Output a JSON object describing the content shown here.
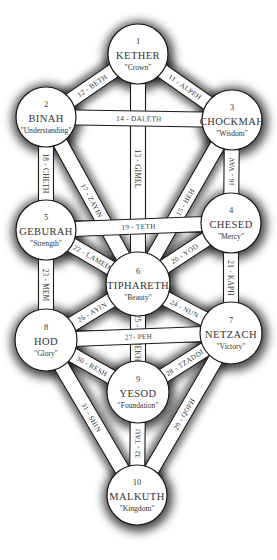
{
  "diagram": {
    "sephiroth": [
      {
        "id": 1,
        "number": "1",
        "name": "KETHER",
        "meaning": "\"Crown\"",
        "cx": 138,
        "cy": 54,
        "r": 30
      },
      {
        "id": 2,
        "number": "2",
        "name": "BINAH",
        "meaning": "\"Understanding\"",
        "cx": 46,
        "cy": 117,
        "r": 30
      },
      {
        "id": 3,
        "number": "3",
        "name": "CHOCKMAH",
        "meaning": "\"Wisdom\"",
        "cx": 232,
        "cy": 120,
        "r": 30
      },
      {
        "id": 4,
        "number": "4",
        "name": "CHESED",
        "meaning": "\"Mercy\"",
        "cx": 231,
        "cy": 223,
        "r": 30
      },
      {
        "id": 5,
        "number": "5",
        "name": "GEBURAH",
        "meaning": "\"Strength\"",
        "cx": 46,
        "cy": 230,
        "r": 30
      },
      {
        "id": 6,
        "number": "6",
        "name": "TIPHARETH",
        "meaning": "\"Beauty\"",
        "cx": 138,
        "cy": 284,
        "r": 32
      },
      {
        "id": 7,
        "number": "7",
        "name": "NETZACH",
        "meaning": "\"Victory\"",
        "cx": 231,
        "cy": 333,
        "r": 31
      },
      {
        "id": 8,
        "number": "8",
        "name": "HOD",
        "meaning": "\"Glory\"",
        "cx": 46,
        "cy": 340,
        "r": 31
      },
      {
        "id": 9,
        "number": "9",
        "name": "YESOD",
        "meaning": "\"Foundation\"",
        "cx": 138,
        "cy": 392,
        "r": 31
      },
      {
        "id": 10,
        "number": "10",
        "name": "MALKUTH",
        "meaning": "\"Kingdom\"",
        "cx": 137,
        "cy": 495,
        "r": 30
      }
    ],
    "paths": [
      {
        "label": "11 - ALPEH",
        "from": 1,
        "to": 3
      },
      {
        "label": "12 - BETH",
        "from": 1,
        "to": 2
      },
      {
        "label": "13 - GIMEL",
        "from": 1,
        "to": 6
      },
      {
        "label": "14 - DALETH",
        "from": 2,
        "to": 3
      },
      {
        "label": "15 - HEH",
        "from": 3,
        "to": 6
      },
      {
        "label": "16 - VAV",
        "from": 3,
        "to": 4
      },
      {
        "label": "17 - ZAYIN",
        "from": 2,
        "to": 6
      },
      {
        "label": "18 - CHETH",
        "from": 2,
        "to": 5
      },
      {
        "label": "19 - TETH",
        "from": 5,
        "to": 4
      },
      {
        "label": "20 - YOD",
        "from": 4,
        "to": 6
      },
      {
        "label": "21 - KAPH",
        "from": 4,
        "to": 7
      },
      {
        "label": "22 - LAMED",
        "from": 5,
        "to": 6
      },
      {
        "label": "23 - MEM",
        "from": 5,
        "to": 8
      },
      {
        "label": "24 - NUN",
        "from": 6,
        "to": 7
      },
      {
        "label": "25 - SAMEKH",
        "from": 6,
        "to": 9
      },
      {
        "label": "26 - AYIN",
        "from": 6,
        "to": 8
      },
      {
        "label": "27- PEH",
        "from": 8,
        "to": 7
      },
      {
        "label": "28 - TZADDI",
        "from": 7,
        "to": 9
      },
      {
        "label": "29 - QOPH",
        "from": 7,
        "to": 10
      },
      {
        "label": "30 - RESH",
        "from": 8,
        "to": 9
      },
      {
        "label": "31 - SHIN",
        "from": 8,
        "to": 10
      },
      {
        "label": "32 - TAU",
        "from": 9,
        "to": 10
      }
    ],
    "colors": {
      "background": "#ffffff",
      "stroke": "#1a1a1a",
      "text": "#333333",
      "shadow": "#000000"
    }
  }
}
